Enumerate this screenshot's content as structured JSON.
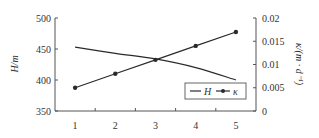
{
  "chart_data": {
    "type": "line",
    "title": "",
    "x": [
      1,
      2,
      3,
      4,
      5
    ],
    "xlabel": "",
    "x_tick_labels": [
      "1",
      "2",
      "3",
      "4",
      "5"
    ],
    "xlim": [
      0.5,
      5.5
    ],
    "ylabel_left": "H/m",
    "ylim_left": [
      350,
      500
    ],
    "y_ticks_left": [
      350,
      400,
      450,
      500
    ],
    "y_tick_labels_left": [
      "350",
      "400",
      "450",
      "500"
    ],
    "ylabel_right": "κ/(m · d⁻¹)",
    "ylim_right": [
      0,
      0.02
    ],
    "y_ticks_right": [
      0,
      0.005,
      0.01,
      0.015,
      0.02
    ],
    "y_tick_labels_right": [
      "0",
      "0.005",
      "0.01",
      "0.015",
      "0.02"
    ],
    "grid": false,
    "legend_position": "bottom-right",
    "series": [
      {
        "name": "H",
        "axis": "left",
        "marker": "none",
        "values": [
          453,
          443,
          434,
          420,
          400
        ]
      },
      {
        "name": "κ",
        "axis": "right",
        "marker": "circle",
        "values": [
          0.005,
          0.008,
          0.011,
          0.014,
          0.017
        ]
      }
    ],
    "colors": {
      "line": "#2a2a2a",
      "axis": "#555555"
    }
  }
}
